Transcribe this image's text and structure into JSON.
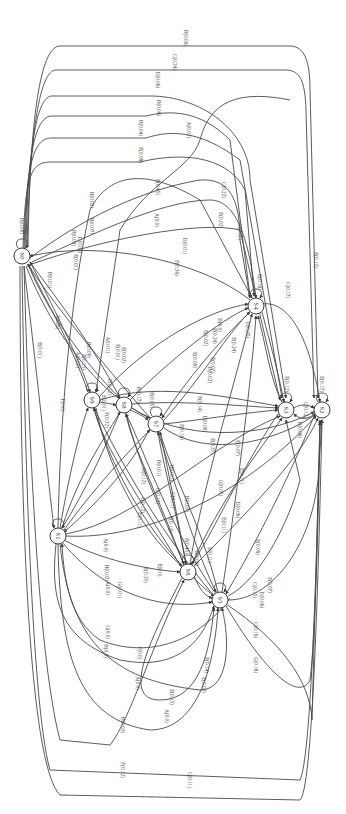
{
  "diagram": {
    "type": "state-transition-graph",
    "orientation": "rotated-90-clockwise",
    "nodes": [
      {
        "id": "S0",
        "label": "S0",
        "x": 22,
        "y": 256
      },
      {
        "id": "S1",
        "label": "S1",
        "x": 58,
        "y": 536
      },
      {
        "id": "S2",
        "label": "S2",
        "x": 322,
        "y": 410
      },
      {
        "id": "S3",
        "label": "S3",
        "x": 286,
        "y": 410
      },
      {
        "id": "S4",
        "label": "S4",
        "x": 256,
        "y": 306
      },
      {
        "id": "S5",
        "label": "S5",
        "x": 220,
        "y": 600
      },
      {
        "id": "S6",
        "label": "S6",
        "x": 188,
        "y": 572
      },
      {
        "id": "S7",
        "label": "S7",
        "x": 156,
        "y": 424
      },
      {
        "id": "S8",
        "label": "S8",
        "x": 124,
        "y": 405
      },
      {
        "id": "S9",
        "label": "S9",
        "x": 92,
        "y": 400
      }
    ],
    "edge_labels": [
      {
        "text": "B(0.06)",
        "x": 186,
        "y": 38
      },
      {
        "text": "C(0.24)",
        "x": 175,
        "y": 62
      },
      {
        "text": "D(0.06)",
        "x": 158,
        "y": 80
      },
      {
        "text": "B(0.06)",
        "x": 159,
        "y": 108
      },
      {
        "text": "B(0.04)",
        "x": 141,
        "y": 128
      },
      {
        "text": "A(0.01)",
        "x": 189,
        "y": 130
      },
      {
        "text": "E(0.08)",
        "x": 141,
        "y": 155
      },
      {
        "text": "E(0.45)",
        "x": 158,
        "y": 187
      },
      {
        "text": "C(0.22)",
        "x": 224,
        "y": 190
      },
      {
        "text": "B(0.09)",
        "x": 22,
        "y": 226
      },
      {
        "text": "H(0.02)",
        "x": 92,
        "y": 200
      },
      {
        "text": "H(0.07)",
        "x": 92,
        "y": 226
      },
      {
        "text": "B(0.02)",
        "x": 74,
        "y": 238
      },
      {
        "text": "D(0.03)",
        "x": 80,
        "y": 245
      },
      {
        "text": "E(0.01)",
        "x": 76,
        "y": 262
      },
      {
        "text": "B(0.01)",
        "x": 50,
        "y": 280
      },
      {
        "text": "J(0.26)",
        "x": 58,
        "y": 322
      },
      {
        "text": "E(0.01)",
        "x": 40,
        "y": 350
      },
      {
        "text": "A(0.0)",
        "x": 157,
        "y": 220
      },
      {
        "text": "E(0.02)",
        "x": 221,
        "y": 220
      },
      {
        "text": "C(0.11)",
        "x": 240,
        "y": 232
      },
      {
        "text": "D(0.01)",
        "x": 185,
        "y": 246
      },
      {
        "text": "F(0.36)",
        "x": 177,
        "y": 268
      },
      {
        "text": "F(0.0)",
        "x": 63,
        "y": 405
      },
      {
        "text": "A(0.07)",
        "x": 78,
        "y": 360
      },
      {
        "text": "E(0.15)",
        "x": 84,
        "y": 362
      },
      {
        "text": "B(0.09)",
        "x": 89,
        "y": 350
      },
      {
        "text": "A(0.01)",
        "x": 108,
        "y": 345
      },
      {
        "text": "E(0.01)",
        "x": 118,
        "y": 352
      },
      {
        "text": "E(0.02)",
        "x": 124,
        "y": 355
      },
      {
        "text": "F(0.12)",
        "x": 110,
        "y": 387
      },
      {
        "text": "E(0.01)",
        "x": 104,
        "y": 403
      },
      {
        "text": "F(0.32)",
        "x": 107,
        "y": 420
      },
      {
        "text": "B(0.17)",
        "x": 139,
        "y": 395
      },
      {
        "text": "E(0.05)",
        "x": 152,
        "y": 400
      },
      {
        "text": "E(0.09)",
        "x": 195,
        "y": 360
      },
      {
        "text": "E(0.02)",
        "x": 206,
        "y": 338
      },
      {
        "text": "E(0.24)",
        "x": 215,
        "y": 336
      },
      {
        "text": "B(0.0)",
        "x": 220,
        "y": 325
      },
      {
        "text": "E(0.07)",
        "x": 213,
        "y": 365
      },
      {
        "text": "B(0.02)",
        "x": 210,
        "y": 375
      },
      {
        "text": "E(0.16)",
        "x": 260,
        "y": 282
      },
      {
        "text": "D(0.05)",
        "x": 248,
        "y": 330
      },
      {
        "text": "E(0.24)",
        "x": 234,
        "y": 345
      },
      {
        "text": "C(0.17)",
        "x": 288,
        "y": 290
      },
      {
        "text": "E(0.17)",
        "x": 316,
        "y": 260
      },
      {
        "text": "E(0.12)",
        "x": 287,
        "y": 384
      },
      {
        "text": "D(0.06)",
        "x": 300,
        "y": 430
      },
      {
        "text": "C(0.12)",
        "x": 306,
        "y": 410
      },
      {
        "text": "E(0.17)",
        "x": 322,
        "y": 384
      },
      {
        "text": "E(0.14)",
        "x": 200,
        "y": 404
      },
      {
        "text": "E(0.25)",
        "x": 213,
        "y": 446
      },
      {
        "text": "E(0.07)",
        "x": 238,
        "y": 448
      },
      {
        "text": "E(0.16)",
        "x": 182,
        "y": 432
      },
      {
        "text": "D(0.09)",
        "x": 205,
        "y": 424
      },
      {
        "text": "G(0.05)",
        "x": 221,
        "y": 488
      },
      {
        "text": "D(0.06)",
        "x": 238,
        "y": 510
      },
      {
        "text": "E(0.11)",
        "x": 242,
        "y": 476
      },
      {
        "text": "E(0.11)",
        "x": 224,
        "y": 525
      },
      {
        "text": "E(0.06)",
        "x": 258,
        "y": 547
      },
      {
        "text": "C(0.15)",
        "x": 255,
        "y": 590
      },
      {
        "text": "E(0.07)",
        "x": 270,
        "y": 585
      },
      {
        "text": "B(0.01)",
        "x": 159,
        "y": 468
      },
      {
        "text": "G(0.12)",
        "x": 158,
        "y": 496
      },
      {
        "text": "G(0.11)",
        "x": 173,
        "y": 500
      },
      {
        "text": "H(0.01)",
        "x": 172,
        "y": 473
      },
      {
        "text": "E(0.17)",
        "x": 143,
        "y": 505
      },
      {
        "text": "E(0.12)",
        "x": 171,
        "y": 524
      },
      {
        "text": "B(0.07)",
        "x": 187,
        "y": 504
      },
      {
        "text": "E(0.11)",
        "x": 140,
        "y": 520
      },
      {
        "text": "G(0.12)",
        "x": 144,
        "y": 476
      },
      {
        "text": "A(0.0)",
        "x": 106,
        "y": 545
      },
      {
        "text": "H(0.02)",
        "x": 107,
        "y": 573
      },
      {
        "text": "A(0.0)",
        "x": 108,
        "y": 588
      },
      {
        "text": "G(0.01)",
        "x": 120,
        "y": 590
      },
      {
        "text": "E(0.35)",
        "x": 146,
        "y": 575
      },
      {
        "text": "E(0.0)",
        "x": 160,
        "y": 570
      },
      {
        "text": "E(0.45)",
        "x": 187,
        "y": 546
      },
      {
        "text": "E(0.06)",
        "x": 197,
        "y": 558
      },
      {
        "text": "E(0.11)",
        "x": 210,
        "y": 555
      },
      {
        "text": "D(0.06)",
        "x": 262,
        "y": 600
      },
      {
        "text": "C(0.16)",
        "x": 256,
        "y": 630
      },
      {
        "text": "G(0.18)",
        "x": 256,
        "y": 665
      },
      {
        "text": "B(0.0)",
        "x": 106,
        "y": 651
      },
      {
        "text": "G(0.0)",
        "x": 108,
        "y": 632
      },
      {
        "text": "F(0.0)",
        "x": 140,
        "y": 653
      },
      {
        "text": "A(0.0)",
        "x": 138,
        "y": 683
      },
      {
        "text": "E(0.14)",
        "x": 207,
        "y": 665
      },
      {
        "text": "E(0.02)",
        "x": 204,
        "y": 685
      },
      {
        "text": "E(0.15)",
        "x": 172,
        "y": 697
      },
      {
        "text": "A(0.0)",
        "x": 167,
        "y": 716
      },
      {
        "text": "B(0.03)",
        "x": 123,
        "y": 725
      },
      {
        "text": "F(0.12)",
        "x": 123,
        "y": 770
      },
      {
        "text": "C(0.11)",
        "x": 190,
        "y": 780
      }
    ]
  }
}
